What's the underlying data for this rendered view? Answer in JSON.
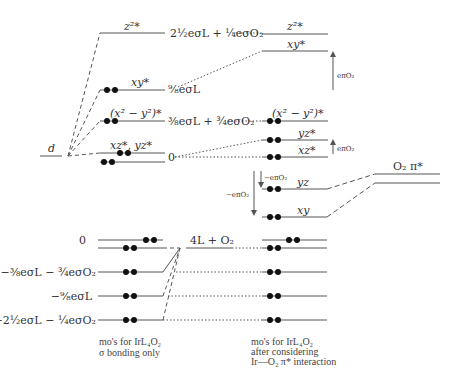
{
  "diagram": {
    "colors": {
      "line": "#555555",
      "electron": "#111111",
      "text": "#333333"
    },
    "left_orbital": {
      "label": "d"
    },
    "upper_levels": [
      {
        "name": "z2*",
        "label": "z²*",
        "energy": "2½eσL + ¼eσO₂",
        "occupied": false
      },
      {
        "name": "xy*",
        "label": "xy*",
        "energy": "⁹⁄₈eσL",
        "occupied": true
      },
      {
        "name": "x2-y2*",
        "label": "(x² − y²)*",
        "energy": "⅜eσL + ¾eσO₂",
        "occupied": true
      },
      {
        "name": "xz*,yz*",
        "label": "xz*, yz*",
        "energy": "0",
        "occupied": true
      }
    ],
    "right_upper_levels": [
      {
        "label": "z²*"
      },
      {
        "label": "xy*"
      },
      {
        "label": "(x² − y²)*"
      },
      {
        "label": "yz*"
      },
      {
        "label": "xz*"
      }
    ],
    "right_middle_levels": [
      {
        "label": "yz"
      },
      {
        "label": "xy"
      }
    ],
    "arrows": {
      "xy_shift": "eπO₂",
      "yz_shift": "eπO₂",
      "yz_down": "−eπO₂",
      "xy_down": "−eπO₂"
    },
    "o2_level": {
      "label": "O₂ π*"
    },
    "lower_levels": [
      {
        "energy": "0"
      },
      {
        "energy": "−⅜eσL − ¾eσO₂"
      },
      {
        "energy": "−⁹⁄₈eσL"
      },
      {
        "energy": "−2½eσL − ¼eσO₂"
      }
    ],
    "ligand_label": "4L + O₂",
    "captions": {
      "left": [
        "mo's for IrL₄O₂",
        "σ bonding only"
      ],
      "right": [
        "mo's for IrL₄O₂",
        "after considering",
        "Ir—O₂ π* interaction"
      ]
    }
  }
}
